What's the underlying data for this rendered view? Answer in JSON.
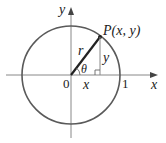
{
  "diagram": {
    "type": "unit-circle",
    "colors": {
      "circle": "#5a5a5a",
      "axes": "#777777",
      "radius": "#222222",
      "text": "#222222"
    },
    "labels": {
      "y_axis": "y",
      "x_axis": "x",
      "origin": "0",
      "one": "1",
      "point": "P(x, y)",
      "radius": "r",
      "vertical_leg": "y",
      "horizontal_leg": "x",
      "angle": "θ"
    }
  }
}
